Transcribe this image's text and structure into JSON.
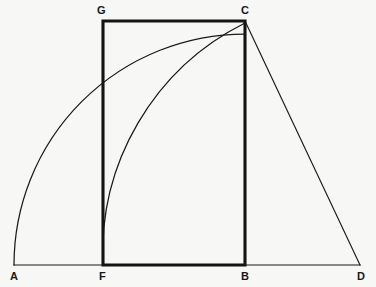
{
  "figure": {
    "kind": "geometry-construction",
    "background_color": "#f7f7f5",
    "ink_color": "#1a1a1a",
    "width": 376,
    "height": 287,
    "labels": {
      "A": "A",
      "B": "B",
      "C": "C",
      "D": "D",
      "F": "F",
      "G": "G"
    }
  },
  "chart_data": {
    "type": "scatter",
    "title": "",
    "subtitle": "",
    "xlabel": "",
    "ylabel": "",
    "grid": false,
    "legend": null,
    "xlim": [
      0,
      376
    ],
    "ylim": [
      287,
      0
    ],
    "points": [
      {
        "name": "A",
        "x": 14,
        "y": 265,
        "label": "A",
        "label_x": 14,
        "label_y": 277,
        "label_anchor": "middle"
      },
      {
        "name": "F",
        "x": 103,
        "y": 265,
        "label": "F",
        "label_x": 103,
        "label_y": 277,
        "label_anchor": "middle"
      },
      {
        "name": "B",
        "x": 245,
        "y": 265,
        "label": "B",
        "label_x": 245,
        "label_y": 277,
        "label_anchor": "middle"
      },
      {
        "name": "D",
        "x": 360,
        "y": 265,
        "label": "D",
        "label_x": 362,
        "label_y": 277,
        "label_anchor": "middle"
      },
      {
        "name": "G",
        "x": 103,
        "y": 21,
        "label": "G",
        "label_x": 101,
        "label_y": 11,
        "label_anchor": "middle"
      },
      {
        "name": "C",
        "x": 245,
        "y": 21,
        "label": "C",
        "label_x": 245,
        "label_y": 11,
        "label_anchor": "middle"
      }
    ],
    "segments": [
      {
        "name": "baseline-AD",
        "from": "A",
        "to": "D",
        "x1": 14,
        "y1": 265,
        "x2": 360,
        "y2": 265,
        "weight": "thin"
      },
      {
        "name": "chord-CD",
        "from": "C",
        "to": "D",
        "x1": 245,
        "y1": 21,
        "x2": 360,
        "y2": 265,
        "weight": "thin"
      },
      {
        "name": "rect-GF",
        "from": "G",
        "to": "F",
        "x1": 103,
        "y1": 21,
        "x2": 103,
        "y2": 265,
        "weight": "thick"
      },
      {
        "name": "rect-GC",
        "from": "G",
        "to": "C",
        "x1": 103,
        "y1": 21,
        "x2": 245,
        "y2": 21,
        "weight": "thick"
      },
      {
        "name": "rect-CB",
        "from": "C",
        "to": "B",
        "x1": 245,
        "y1": 21,
        "x2": 245,
        "y2": 265,
        "weight": "thick"
      },
      {
        "name": "rect-FB",
        "from": "F",
        "to": "B",
        "x1": 103,
        "y1": 265,
        "x2": 245,
        "y2": 265,
        "weight": "thick"
      }
    ],
    "arcs": [
      {
        "name": "arc-A-to-C",
        "from": "A",
        "to": "C",
        "center": "B",
        "center_x": 245,
        "center_y": 265,
        "radius": 231,
        "path": "M 14 265 A 231 231 0 0 1 245 34"
      },
      {
        "name": "arc-F-to-C",
        "from": "F",
        "to": "C",
        "center": "D",
        "center_x": 360,
        "center_y": 265,
        "radius": 257,
        "path": "M 103 265 A 257 257 0 0 1 245 23"
      }
    ]
  }
}
